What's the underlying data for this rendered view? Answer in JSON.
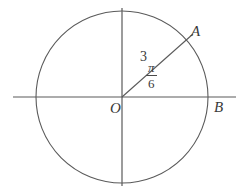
{
  "figure": {
    "background_color": "#ffffff",
    "stroke_color": "#5a5a5a",
    "text_color": "#3a3a3a",
    "labels": {
      "point_a": "A",
      "point_b": "B",
      "origin": "O",
      "radius_value": "3",
      "angle_numerator": "π",
      "angle_denominator": "6"
    },
    "geometry": {
      "center_x": 122,
      "center_y": 97,
      "radius": 86,
      "x_axis_start_x": 13,
      "x_axis_end_x": 236,
      "y_axis_start_y": 8,
      "y_axis_end_y": 186,
      "radius_angle_degrees": 30,
      "radius_line_end_x": 193,
      "radius_line_end_y": 34
    }
  }
}
